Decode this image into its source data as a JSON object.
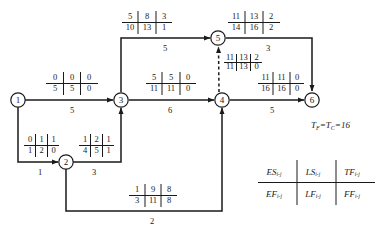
{
  "diagram": {
    "type": "cpm-network-diagram",
    "title": "",
    "stroke_color": "#1a1a1a",
    "background_color": "#ffffff",
    "nodes": [
      {
        "id": "1",
        "label": "1",
        "cx": 18,
        "cy": 100
      },
      {
        "id": "2",
        "label": "2",
        "cx": 66,
        "cy": 162
      },
      {
        "id": "3",
        "label": "3",
        "cx": 121,
        "cy": 100
      },
      {
        "id": "4",
        "label": "4",
        "cx": 222,
        "cy": 100
      },
      {
        "id": "5",
        "label": "5",
        "cx": 218,
        "cy": 38
      },
      {
        "id": "6",
        "label": "6",
        "cx": 312,
        "cy": 100
      }
    ],
    "activities": [
      {
        "name": "activity-1-3",
        "from": "1",
        "to": "3",
        "duration": "5",
        "top_row": [
          "0",
          "0",
          "0"
        ],
        "bottom_row": [
          "5",
          "5",
          "0"
        ],
        "dummy": false
      },
      {
        "name": "activity-1-2",
        "from": "1",
        "to": "2",
        "duration": "1",
        "top_row": [
          "0",
          "1",
          "1"
        ],
        "bottom_row": [
          "1",
          "2",
          "0"
        ],
        "dummy": false
      },
      {
        "name": "activity-2-3",
        "from": "2",
        "to": "3",
        "duration": "3",
        "top_row": [
          "1",
          "2",
          "1"
        ],
        "bottom_row": [
          "4",
          "5",
          "1"
        ],
        "dummy": false
      },
      {
        "name": "activity-2-4",
        "from": "2",
        "to": "4",
        "duration": "2",
        "top_row": [
          "1",
          "9",
          "8"
        ],
        "bottom_row": [
          "3",
          "11",
          "8"
        ],
        "dummy": false
      },
      {
        "name": "activity-3-5",
        "from": "3",
        "to": "5",
        "duration": "5",
        "top_row": [
          "5",
          "8",
          "3"
        ],
        "bottom_row": [
          "10",
          "13",
          "1"
        ],
        "dummy": false
      },
      {
        "name": "activity-3-4",
        "from": "3",
        "to": "4",
        "duration": "6",
        "top_row": [
          "5",
          "5",
          "0"
        ],
        "bottom_row": [
          "11",
          "11",
          "0"
        ],
        "dummy": false
      },
      {
        "name": "activity-4-5-dummy",
        "from": "4",
        "to": "5",
        "duration": "",
        "top_row": [
          "11",
          "13",
          "2"
        ],
        "bottom_row": [
          "11",
          "13",
          "0"
        ],
        "dummy": true
      },
      {
        "name": "activity-5-6",
        "from": "5",
        "to": "6",
        "duration": "3",
        "top_row": [
          "11",
          "13",
          "2"
        ],
        "bottom_row": [
          "14",
          "16",
          "2"
        ],
        "dummy": false
      },
      {
        "name": "activity-4-6",
        "from": "4",
        "to": "6",
        "duration": "5",
        "top_row": [
          "11",
          "11",
          "0"
        ],
        "bottom_row": [
          "16",
          "16",
          "0"
        ],
        "dummy": false
      }
    ],
    "project_duration": {
      "symbol_1": "T",
      "symbol_1_sub": "F",
      "symbol_2": "T",
      "symbol_2_sub": "C",
      "equals": "=",
      "value": "16",
      "full_text": "TF=TC=16"
    },
    "legend": {
      "subscript": "i-j",
      "cells": [
        {
          "name": "legend-es",
          "symbol": "ES",
          "sub": "i-j"
        },
        {
          "name": "legend-ls",
          "symbol": "LS",
          "sub": "i-j"
        },
        {
          "name": "legend-tf",
          "symbol": "TF",
          "sub": "i-j"
        },
        {
          "name": "legend-ef",
          "symbol": "EF",
          "sub": "i-j"
        },
        {
          "name": "legend-lf",
          "symbol": "LF",
          "sub": "i-j"
        },
        {
          "name": "legend-ff",
          "symbol": "FF",
          "sub": "i-j"
        }
      ]
    }
  }
}
